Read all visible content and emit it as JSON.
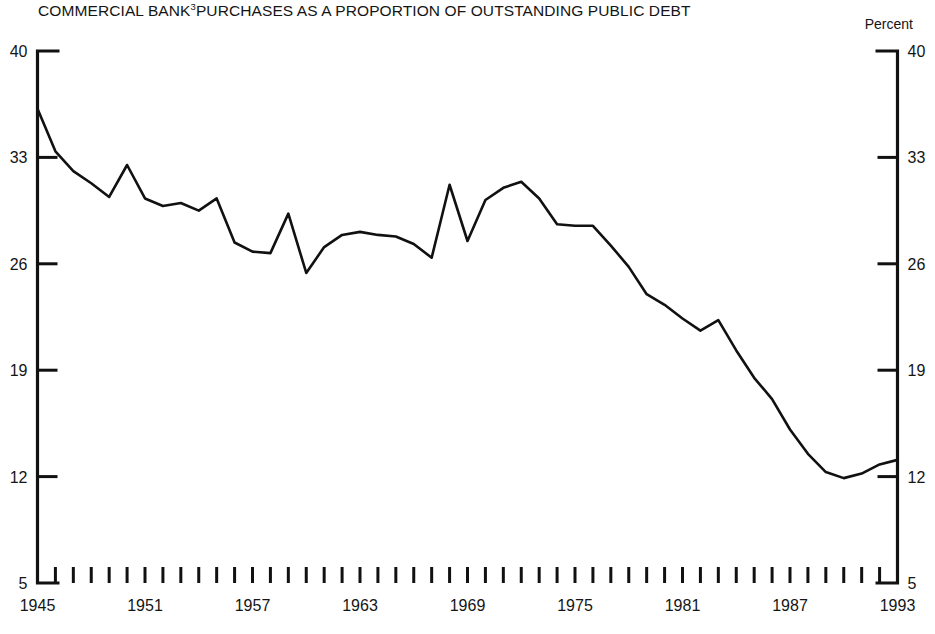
{
  "chart_data": {
    "type": "line",
    "title_main": "COMMERCIAL BANK",
    "title_superscript": "3",
    "title_rest": "PURCHASES AS A PROPORTION OF OUTSTANDING PUBLIC DEBT",
    "unit_label": "Percent",
    "xlabel": "",
    "ylabel": "Percent",
    "ylim": [
      5,
      40
    ],
    "xlim": [
      1945,
      1993
    ],
    "grid": false,
    "legend": null,
    "y_ticks": [
      40,
      33,
      26,
      19,
      12,
      5
    ],
    "x_ticks_labeled": [
      1945,
      1951,
      1957,
      1963,
      1969,
      1975,
      1981,
      1987,
      1993
    ],
    "x_tick_interval_years": 1,
    "line_color": "#111111",
    "x": [
      1945,
      1946,
      1947,
      1948,
      1949,
      1950,
      1951,
      1952,
      1953,
      1954,
      1955,
      1956,
      1957,
      1958,
      1959,
      1960,
      1961,
      1962,
      1963,
      1964,
      1965,
      1966,
      1967,
      1968,
      1969,
      1970,
      1971,
      1972,
      1973,
      1974,
      1975,
      1976,
      1977,
      1978,
      1979,
      1980,
      1981,
      1982,
      1983,
      1984,
      1985,
      1986,
      1987,
      1988,
      1989,
      1990,
      1991,
      1992,
      1993
    ],
    "values": [
      36.2,
      33.4,
      32.1,
      31.3,
      30.4,
      32.5,
      30.3,
      29.8,
      30.0,
      29.5,
      30.3,
      27.4,
      26.8,
      26.7,
      29.3,
      25.4,
      27.1,
      27.9,
      28.1,
      27.9,
      27.8,
      27.3,
      26.4,
      31.2,
      27.5,
      30.2,
      31.0,
      31.4,
      30.3,
      28.6,
      28.5,
      28.5,
      27.2,
      25.8,
      24.0,
      23.3,
      22.4,
      21.6,
      22.3,
      20.3,
      18.5,
      17.1,
      15.1,
      13.5,
      12.3,
      11.9,
      12.2,
      12.8,
      13.1
    ],
    "footnote": ""
  }
}
